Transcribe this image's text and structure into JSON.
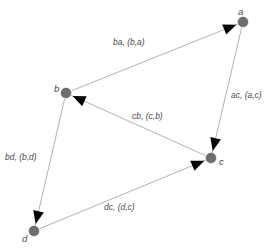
{
  "figure": {
    "type": "directed-graph",
    "background_color": "#ffffff",
    "node_color": "#6e6e6e",
    "edge_color": "#a9a9a9",
    "arrow_color": "#000000",
    "label_color": "#4a4a4a"
  },
  "graph_data": {
    "type": "diagram",
    "directed": true,
    "nodes": [
      {
        "id": "a",
        "label": "a",
        "x": 243,
        "y": 22,
        "r": 5.0,
        "label_x": 238,
        "label_y": 7
      },
      {
        "id": "b",
        "label": "b",
        "x": 66,
        "y": 93,
        "r": 5.0,
        "label_x": 54,
        "label_y": 84
      },
      {
        "id": "c",
        "label": "c",
        "x": 211,
        "y": 158,
        "r": 5.0,
        "label_x": 219,
        "label_y": 157
      },
      {
        "id": "d",
        "label": "d",
        "x": 34,
        "y": 231,
        "r": 5.0,
        "label_x": 22,
        "label_y": 234
      }
    ],
    "edges": [
      {
        "id": "ba",
        "from": "b",
        "to": "a",
        "label": "ba, (b,a)",
        "label_x": 113,
        "label_y": 38
      },
      {
        "id": "ac",
        "from": "a",
        "to": "c",
        "label": "ac, (a,c)",
        "label_x": 231,
        "label_y": 91
      },
      {
        "id": "cb",
        "from": "c",
        "to": "b",
        "label": "cb, (c,b)",
        "label_x": 132,
        "label_y": 112
      },
      {
        "id": "bd",
        "from": "b",
        "to": "d",
        "label": "bd, (b,d)",
        "label_x": 5,
        "label_y": 153
      },
      {
        "id": "dc",
        "from": "d",
        "to": "c",
        "label": "dc, (d,c)",
        "label_x": 104,
        "label_y": 203
      }
    ]
  }
}
